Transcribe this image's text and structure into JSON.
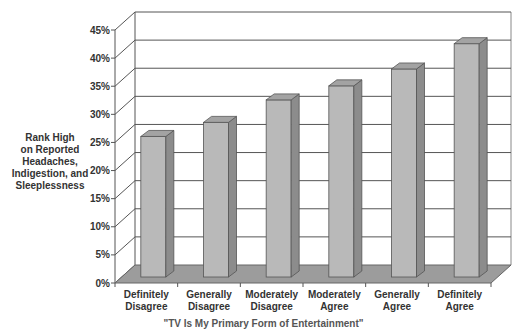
{
  "chart_data": {
    "type": "bar",
    "style": "3d-column",
    "title": "",
    "ylabel_lines": [
      "Rank High",
      "on Reported",
      "Headaches,",
      "Indigestion, and",
      "Sleeplessness"
    ],
    "xlabel": "\"TV Is My Primary Form of Entertainment\"",
    "categories": [
      [
        "Definitely",
        "Disagree"
      ],
      [
        "Generally",
        "Disagree"
      ],
      [
        "Moderately",
        "Disagree"
      ],
      [
        "Moderately",
        "Agree"
      ],
      [
        "Generally",
        "Agree"
      ],
      [
        "Definitely",
        "Agree"
      ]
    ],
    "values": [
      25,
      27.5,
      31.5,
      34,
      37,
      41.5
    ],
    "yticks": [
      "0%",
      "5%",
      "10%",
      "15%",
      "20%",
      "25%",
      "30%",
      "35%",
      "40%",
      "45%"
    ],
    "ylim": [
      0,
      45
    ],
    "grid": true,
    "legend": "none",
    "colors": {
      "bar_front": "#b9b9b9",
      "bar_side": "#8c8c8c",
      "bar_top": "#a3a3a3",
      "floor": "#9c9c9c",
      "grid": "#555555"
    }
  }
}
